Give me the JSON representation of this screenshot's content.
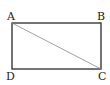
{
  "diagram": {
    "type": "geometry-rectangle",
    "vertices": {
      "A": {
        "label": "A",
        "x": 12,
        "y": 23
      },
      "B": {
        "label": "B",
        "x": 101,
        "y": 23
      },
      "C": {
        "label": "C",
        "x": 101,
        "y": 69
      },
      "D": {
        "label": "D",
        "x": 12,
        "y": 69
      }
    },
    "segments": [
      {
        "from": "A",
        "to": "B"
      },
      {
        "from": "B",
        "to": "C"
      },
      {
        "from": "C",
        "to": "D"
      },
      {
        "from": "D",
        "to": "A"
      },
      {
        "from": "A",
        "to": "C",
        "style": "diagonal"
      }
    ],
    "colors": {
      "edge": "#2a2a2a",
      "diagonal": "#8a8a8a",
      "label": "#1a1a1a"
    }
  }
}
